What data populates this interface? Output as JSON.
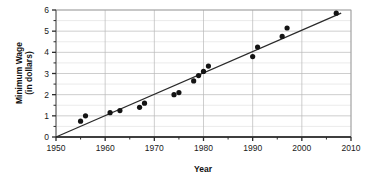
{
  "chart_data": {
    "type": "scatter",
    "title": "",
    "xlabel": "Year",
    "ylabel": "Minimum Wage (in dollars)",
    "ylabel_line1": "Minimum Wage",
    "ylabel_line2": "(in dollars)",
    "xlim": [
      1950,
      2010
    ],
    "ylim": [
      0,
      6
    ],
    "grid": true,
    "legend": "none",
    "x_ticks": [
      1950,
      1960,
      1970,
      1980,
      1990,
      2000,
      2010
    ],
    "x_tick_labels": [
      "1950",
      "1960",
      "1970",
      "1980",
      "1990",
      "2000",
      "2010"
    ],
    "x_minor_ticks": [
      1955,
      1965,
      1975,
      1985,
      1995,
      2005
    ],
    "y_ticks": [
      0,
      1,
      2,
      3,
      4,
      5,
      6
    ],
    "y_tick_labels": [
      "0",
      "1",
      "2",
      "3",
      "4",
      "5",
      "6"
    ],
    "y_minor_ticks": [
      0.5,
      1.5,
      2.5,
      3.5,
      4.5,
      5.5
    ],
    "series": [
      {
        "name": "Minimum Wage",
        "marker": "filled-circle",
        "color": "#141414",
        "points": [
          {
            "x": 1955,
            "y": 0.75
          },
          {
            "x": 1956,
            "y": 1.0
          },
          {
            "x": 1961,
            "y": 1.15
          },
          {
            "x": 1963,
            "y": 1.25
          },
          {
            "x": 1967,
            "y": 1.4
          },
          {
            "x": 1968,
            "y": 1.6
          },
          {
            "x": 1974,
            "y": 2.0
          },
          {
            "x": 1975,
            "y": 2.1
          },
          {
            "x": 1978,
            "y": 2.65
          },
          {
            "x": 1979,
            "y": 2.9
          },
          {
            "x": 1980,
            "y": 3.1
          },
          {
            "x": 1981,
            "y": 3.35
          },
          {
            "x": 1990,
            "y": 3.8
          },
          {
            "x": 1991,
            "y": 4.25
          },
          {
            "x": 1996,
            "y": 4.75
          },
          {
            "x": 1997,
            "y": 5.15
          },
          {
            "x": 2007,
            "y": 5.85
          }
        ]
      }
    ],
    "trendline": {
      "name": "line of best fit",
      "color": "#2a2a2a",
      "x_start": 1950,
      "y_start": 0.0,
      "x_end": 2008,
      "y_end": 5.85
    }
  },
  "colors": {
    "point": "#141414",
    "trendline": "#2a2a2a",
    "grid_major": "#b9b9b9",
    "grid_minor": "#dedede",
    "frame": "#9a9a9a",
    "baseline": "#3f3f3f",
    "text": "#1a1a1a",
    "background": "#ffffff"
  }
}
